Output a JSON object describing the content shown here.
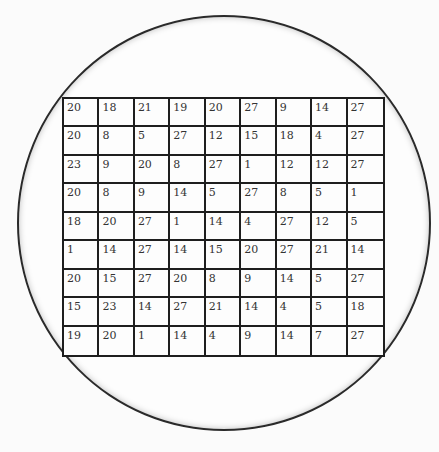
{
  "diagram": {
    "grid": [
      [
        "20",
        "18",
        "21",
        "19",
        "20",
        "27",
        "9",
        "14",
        "27"
      ],
      [
        "20",
        "8",
        "5",
        "27",
        "12",
        "15",
        "18",
        "4",
        "27"
      ],
      [
        "23",
        "9",
        "20",
        "8",
        "27",
        "1",
        "12",
        "12",
        "27"
      ],
      [
        "20",
        "8",
        "9",
        "14",
        "5",
        "27",
        "8",
        "5",
        "1"
      ],
      [
        "18",
        "20",
        "27",
        "1",
        "14",
        "4",
        "27",
        "12",
        "5"
      ],
      [
        "1",
        "14",
        "27",
        "14",
        "15",
        "20",
        "27",
        "21",
        "14"
      ],
      [
        "20",
        "15",
        "27",
        "20",
        "8",
        "9",
        "14",
        "5",
        "27"
      ],
      [
        "15",
        "23",
        "14",
        "27",
        "21",
        "14",
        "4",
        "5",
        "18"
      ],
      [
        "19",
        "20",
        "1",
        "14",
        "4",
        "9",
        "14",
        "7",
        "27"
      ]
    ]
  }
}
